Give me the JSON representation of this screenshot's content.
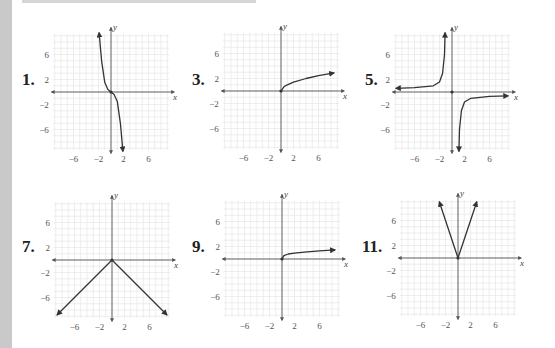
{
  "page": {
    "background": "#ffffff",
    "side_bar_color": "#c9c9c9",
    "grid_color": "#e2e2e2",
    "axis_color": "#555555",
    "curve_color": "#333333"
  },
  "problems": [
    {
      "number": "1.",
      "description": "Decreasing cubic-like curve through origin, y = -x^3 shape",
      "origin": [
        111,
        92
      ],
      "label_pos": [
        22,
        70
      ]
    },
    {
      "number": "3.",
      "description": "Square root curve starting at origin, y = sqrt(x)",
      "origin": [
        281,
        91
      ],
      "label_pos": [
        192,
        70
      ]
    },
    {
      "number": "5.",
      "description": "Reciprocal curve y = -k/x, branches in quadrants II and IV",
      "origin": [
        452,
        92
      ],
      "label_pos": [
        365,
        70
      ]
    },
    {
      "number": "7.",
      "description": "Inverted V, y = -|x|",
      "origin": [
        112,
        260
      ],
      "label_pos": [
        22,
        237
      ]
    },
    {
      "number": "9.",
      "description": "Root curve from origin, y = x^(1/4) shape",
      "origin": [
        282,
        259
      ],
      "label_pos": [
        192,
        237
      ]
    },
    {
      "number": "11.",
      "description": "V shape, y = 3|x|",
      "origin": [
        458,
        258
      ],
      "label_pos": [
        362,
        237
      ]
    }
  ],
  "axes": {
    "x_label": "x",
    "y_label": "y",
    "x_ticks": [
      "−6",
      "−2",
      "2",
      "6"
    ],
    "y_ticks": [
      "6",
      "2",
      "−2",
      "−6"
    ]
  },
  "chart_data": [
    {
      "type": "line",
      "title": "1.",
      "xlabel": "x",
      "ylabel": "y",
      "xlim": [
        -9,
        9
      ],
      "ylim": [
        -9,
        9
      ],
      "grid": true,
      "x_ticks": [
        -6,
        -2,
        2,
        6
      ],
      "y_ticks": [
        -6,
        -2,
        2,
        6
      ],
      "series": [
        {
          "name": "f",
          "x": [
            -1.9,
            -1.5,
            -1,
            -0.5,
            0,
            0.5,
            1,
            1.5,
            1.9
          ],
          "y": [
            9.5,
            5,
            1.5,
            0.4,
            0,
            -0.4,
            -1.5,
            -5,
            -9.5
          ],
          "arrows": "both"
        }
      ]
    },
    {
      "type": "line",
      "title": "3.",
      "xlabel": "x",
      "ylabel": "y",
      "xlim": [
        -9,
        9
      ],
      "ylim": [
        -9,
        9
      ],
      "grid": true,
      "x_ticks": [
        -6,
        -2,
        2,
        6
      ],
      "y_ticks": [
        -6,
        -2,
        2,
        6
      ],
      "series": [
        {
          "name": "f",
          "x": [
            0,
            0.5,
            1,
            2,
            4,
            6,
            8.5
          ],
          "y": [
            0,
            0.7,
            1,
            1.41,
            2,
            2.45,
            2.9
          ],
          "arrows": "end"
        }
      ]
    },
    {
      "type": "line",
      "title": "5.",
      "xlabel": "x",
      "ylabel": "y",
      "xlim": [
        -9,
        9
      ],
      "ylim": [
        -9,
        9
      ],
      "grid": true,
      "x_ticks": [
        -6,
        -2,
        2,
        6
      ],
      "y_ticks": [
        -6,
        -2,
        2,
        6
      ],
      "series": [
        {
          "name": "left branch",
          "x": [
            -9,
            -6,
            -3,
            -2,
            -1.5,
            -1.2,
            -1.1
          ],
          "y": [
            0.6,
            0.7,
            1,
            1.6,
            3,
            6,
            9.5
          ],
          "arrows": "both"
        },
        {
          "name": "right branch",
          "x": [
            1.1,
            1.2,
            1.5,
            2,
            3,
            6,
            9
          ],
          "y": [
            -9.5,
            -6,
            -3,
            -1.6,
            -1,
            -0.7,
            -0.6
          ],
          "arrows": "both"
        }
      ]
    },
    {
      "type": "line",
      "title": "7.",
      "xlabel": "x",
      "ylabel": "y",
      "xlim": [
        -9,
        9
      ],
      "ylim": [
        -9,
        9
      ],
      "grid": true,
      "x_ticks": [
        -6,
        -2,
        2,
        6
      ],
      "y_ticks": [
        -6,
        -2,
        2,
        6
      ],
      "series": [
        {
          "name": "f",
          "x": [
            -8.8,
            0,
            8.8
          ],
          "y": [
            -8.8,
            0,
            -8.8
          ],
          "arrows": "both"
        }
      ]
    },
    {
      "type": "line",
      "title": "9.",
      "xlabel": "x",
      "ylabel": "y",
      "xlim": [
        -9,
        9
      ],
      "ylim": [
        -9,
        9
      ],
      "grid": true,
      "x_ticks": [
        -6,
        -2,
        2,
        6
      ],
      "y_ticks": [
        -6,
        -2,
        2,
        6
      ],
      "series": [
        {
          "name": "f",
          "x": [
            0,
            0.3,
            1,
            2,
            4,
            6,
            8.5
          ],
          "y": [
            0,
            0.55,
            0.8,
            0.95,
            1.15,
            1.3,
            1.45
          ],
          "arrows": "end"
        }
      ]
    },
    {
      "type": "line",
      "title": "11.",
      "xlabel": "x",
      "ylabel": "y",
      "xlim": [
        -9,
        9
      ],
      "ylim": [
        -9,
        9
      ],
      "grid": true,
      "x_ticks": [
        -6,
        -2,
        2,
        6
      ],
      "y_ticks": [
        -6,
        -2,
        2,
        6
      ],
      "series": [
        {
          "name": "f",
          "x": [
            -3,
            0,
            3
          ],
          "y": [
            9,
            0,
            9
          ],
          "arrows": "both"
        }
      ]
    }
  ]
}
